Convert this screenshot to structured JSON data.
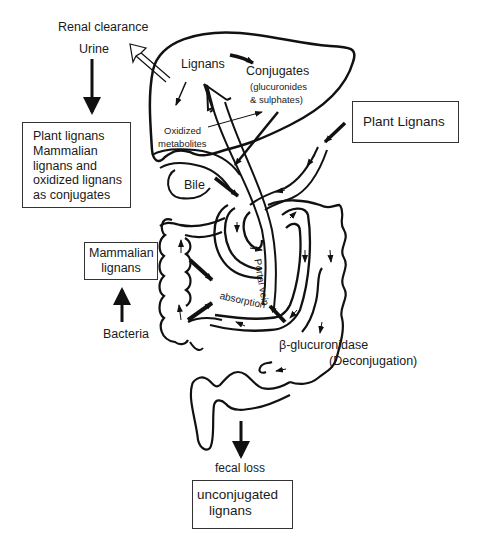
{
  "diagram": {
    "labels": {
      "renal_clearance": "Renal clearance",
      "urine": "Urine",
      "lignans_liver": "Lignans",
      "conjugates": "Conjugates",
      "conjugates_detail_1": "(glucuronides",
      "conjugates_detail_2": "& sulphates)",
      "oxidized_1": "Oxidized",
      "oxidized_2": "metabolites",
      "bile": "Bile",
      "portal_vein": "Portal vein",
      "absorption": "absorption",
      "bacteria": "Bacteria",
      "beta_glucuronidase": "β-glucuronidase",
      "deconjugation": "(Deconjugation)",
      "fecal_loss": "fecal loss"
    },
    "boxes": {
      "urine_box": [
        "Plant lignans",
        "Mammalian",
        "lignans and",
        "oxidized lignans",
        "as conjugates"
      ],
      "plant_lignans": "Plant Lignans",
      "mammalian_lignans": [
        "Mammalian",
        "lignans"
      ],
      "unconjugated": [
        "unconjugated",
        "lignans"
      ]
    },
    "caption": ""
  }
}
